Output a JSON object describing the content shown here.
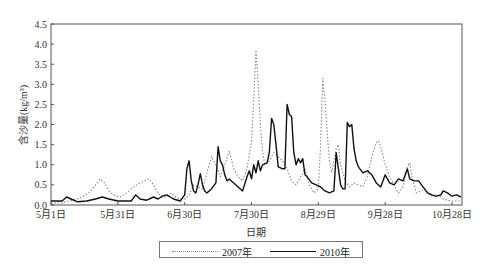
{
  "chart_data": {
    "type": "line",
    "title": "",
    "xlabel": "日期",
    "ylabel": "含沙量(kg/m³)",
    "ylim": [
      0,
      4.5
    ],
    "yticks": [
      "0.0",
      "0.5",
      "1.0",
      "1.5",
      "2.0",
      "2.5",
      "3.0",
      "3.5",
      "4.0",
      "4.5"
    ],
    "xticks": [
      {
        "label": "5月1日",
        "day": 0
      },
      {
        "label": "5月31日",
        "day": 30
      },
      {
        "label": "6月30日",
        "day": 60
      },
      {
        "label": "7月30日",
        "day": 90
      },
      {
        "label": "8月29日",
        "day": 120
      },
      {
        "label": "9月28日",
        "day": 150
      },
      {
        "label": "10月28日",
        "day": 180
      }
    ],
    "xlim_days": [
      0,
      184
    ],
    "grid": false,
    "legend_position": "bottom",
    "series": [
      {
        "name": "2007年",
        "style": "dotted",
        "color": "#888888",
        "points": [
          [
            0,
            0.05
          ],
          [
            5,
            0.05
          ],
          [
            8,
            0.1
          ],
          [
            10,
            0.12
          ],
          [
            14,
            0.2
          ],
          [
            17,
            0.3
          ],
          [
            20,
            0.5
          ],
          [
            22,
            0.65
          ],
          [
            24,
            0.55
          ],
          [
            26,
            0.35
          ],
          [
            28,
            0.25
          ],
          [
            31,
            0.2
          ],
          [
            34,
            0.3
          ],
          [
            37,
            0.45
          ],
          [
            40,
            0.55
          ],
          [
            42,
            0.6
          ],
          [
            44,
            0.65
          ],
          [
            46,
            0.5
          ],
          [
            48,
            0.3
          ],
          [
            50,
            0.2
          ],
          [
            52,
            0.2
          ],
          [
            54,
            0.3
          ],
          [
            56,
            0.2
          ],
          [
            58,
            0.15
          ],
          [
            60,
            0.15
          ],
          [
            62,
            0.25
          ],
          [
            64,
            0.5
          ],
          [
            66,
            0.45
          ],
          [
            68,
            0.4
          ],
          [
            70,
            0.8
          ],
          [
            72,
            1.2
          ],
          [
            74,
            1.0
          ],
          [
            76,
            0.7
          ],
          [
            78,
            1.0
          ],
          [
            80,
            1.35
          ],
          [
            82,
            0.9
          ],
          [
            84,
            0.7
          ],
          [
            86,
            0.6
          ],
          [
            88,
            0.9
          ],
          [
            90,
            1.6
          ],
          [
            91,
            2.6
          ],
          [
            92,
            3.85
          ],
          [
            93,
            3.0
          ],
          [
            94,
            2.0
          ],
          [
            95,
            1.3
          ],
          [
            96,
            1.0
          ],
          [
            98,
            1.1
          ],
          [
            100,
            1.3
          ],
          [
            102,
            1.2
          ],
          [
            104,
            1.1
          ],
          [
            106,
            0.9
          ],
          [
            108,
            0.6
          ],
          [
            110,
            0.5
          ],
          [
            112,
            0.7
          ],
          [
            114,
            0.9
          ],
          [
            116,
            0.5
          ],
          [
            118,
            0.3
          ],
          [
            120,
            0.4
          ],
          [
            121,
            1.5
          ],
          [
            122,
            3.15
          ],
          [
            123,
            2.6
          ],
          [
            124,
            1.8
          ],
          [
            125,
            1.1
          ],
          [
            126,
            0.8
          ],
          [
            128,
            1.4
          ],
          [
            129,
            1.5
          ],
          [
            130,
            1.0
          ],
          [
            132,
            0.6
          ],
          [
            134,
            0.45
          ],
          [
            136,
            0.55
          ],
          [
            138,
            0.5
          ],
          [
            140,
            0.45
          ],
          [
            142,
            0.7
          ],
          [
            144,
            1.2
          ],
          [
            146,
            1.55
          ],
          [
            147,
            1.6
          ],
          [
            148,
            1.45
          ],
          [
            150,
            1.0
          ],
          [
            152,
            0.7
          ],
          [
            154,
            0.5
          ],
          [
            156,
            0.3
          ],
          [
            158,
            0.45
          ],
          [
            160,
            0.95
          ],
          [
            161,
            1.05
          ],
          [
            162,
            0.7
          ],
          [
            164,
            0.3
          ],
          [
            166,
            0.35
          ],
          [
            168,
            0.4
          ],
          [
            170,
            0.25
          ],
          [
            172,
            0.2
          ],
          [
            174,
            0.25
          ],
          [
            176,
            0.15
          ],
          [
            178,
            0.12
          ],
          [
            180,
            0.1
          ],
          [
            184,
            0.1
          ]
        ]
      },
      {
        "name": "2010年",
        "style": "solid",
        "color": "#111111",
        "points": [
          [
            0,
            0.1
          ],
          [
            5,
            0.1
          ],
          [
            7,
            0.2
          ],
          [
            9,
            0.15
          ],
          [
            12,
            0.08
          ],
          [
            16,
            0.1
          ],
          [
            20,
            0.15
          ],
          [
            23,
            0.2
          ],
          [
            26,
            0.15
          ],
          [
            30,
            0.1
          ],
          [
            34,
            0.1
          ],
          [
            36,
            0.1
          ],
          [
            38,
            0.25
          ],
          [
            40,
            0.15
          ],
          [
            43,
            0.12
          ],
          [
            46,
            0.2
          ],
          [
            48,
            0.15
          ],
          [
            50,
            0.22
          ],
          [
            52,
            0.25
          ],
          [
            55,
            0.15
          ],
          [
            58,
            0.1
          ],
          [
            60,
            0.25
          ],
          [
            61,
            0.9
          ],
          [
            62,
            1.1
          ],
          [
            63,
            0.6
          ],
          [
            64,
            0.35
          ],
          [
            65,
            0.3
          ],
          [
            66,
            0.5
          ],
          [
            67,
            0.78
          ],
          [
            68,
            0.5
          ],
          [
            69,
            0.35
          ],
          [
            70,
            0.3
          ],
          [
            72,
            0.4
          ],
          [
            74,
            0.55
          ],
          [
            75,
            1.45
          ],
          [
            76,
            1.1
          ],
          [
            77,
            1.0
          ],
          [
            78,
            0.75
          ],
          [
            79,
            0.6
          ],
          [
            80,
            0.65
          ],
          [
            82,
            0.55
          ],
          [
            84,
            0.45
          ],
          [
            86,
            0.35
          ],
          [
            88,
            0.7
          ],
          [
            89,
            0.85
          ],
          [
            90,
            0.65
          ],
          [
            91,
            1.0
          ],
          [
            92,
            0.8
          ],
          [
            93,
            1.1
          ],
          [
            94,
            0.85
          ],
          [
            95,
            1.0
          ],
          [
            97,
            1.05
          ],
          [
            98,
            1.3
          ],
          [
            99,
            2.15
          ],
          [
            100,
            2.0
          ],
          [
            101,
            1.5
          ],
          [
            102,
            0.95
          ],
          [
            104,
            0.9
          ],
          [
            105,
            0.9
          ],
          [
            106,
            2.5
          ],
          [
            107,
            2.25
          ],
          [
            108,
            2.2
          ],
          [
            109,
            1.3
          ],
          [
            110,
            1.0
          ],
          [
            111,
            1.15
          ],
          [
            112,
            1.05
          ],
          [
            113,
            1.15
          ],
          [
            114,
            0.75
          ],
          [
            115,
            0.7
          ],
          [
            117,
            0.55
          ],
          [
            119,
            0.5
          ],
          [
            121,
            0.45
          ],
          [
            123,
            0.35
          ],
          [
            125,
            0.3
          ],
          [
            127,
            0.35
          ],
          [
            128,
            1.3
          ],
          [
            129,
            0.9
          ],
          [
            130,
            0.5
          ],
          [
            131,
            0.4
          ],
          [
            132,
            0.4
          ],
          [
            133,
            2.05
          ],
          [
            134,
            1.95
          ],
          [
            135,
            2.0
          ],
          [
            136,
            1.4
          ],
          [
            137,
            1.1
          ],
          [
            138,
            0.95
          ],
          [
            140,
            0.8
          ],
          [
            142,
            0.85
          ],
          [
            144,
            0.75
          ],
          [
            146,
            0.55
          ],
          [
            148,
            0.45
          ],
          [
            150,
            0.75
          ],
          [
            152,
            0.55
          ],
          [
            154,
            0.5
          ],
          [
            156,
            0.65
          ],
          [
            158,
            0.6
          ],
          [
            160,
            0.9
          ],
          [
            161,
            0.65
          ],
          [
            163,
            0.6
          ],
          [
            165,
            0.6
          ],
          [
            167,
            0.45
          ],
          [
            169,
            0.3
          ],
          [
            171,
            0.25
          ],
          [
            173,
            0.22
          ],
          [
            175,
            0.25
          ],
          [
            176,
            0.35
          ],
          [
            178,
            0.3
          ],
          [
            180,
            0.22
          ],
          [
            182,
            0.25
          ],
          [
            184,
            0.2
          ]
        ]
      }
    ]
  },
  "legend": {
    "items": [
      {
        "label": "2007年"
      },
      {
        "label": "2010年"
      }
    ]
  }
}
